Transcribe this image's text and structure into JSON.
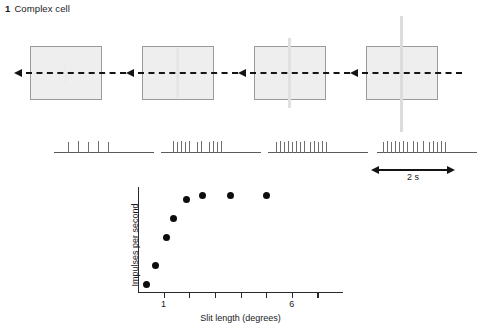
{
  "figure": {
    "number": "1",
    "title": "Complex cell"
  },
  "stimuli": {
    "panels": [
      {
        "id": "panel-1",
        "slit_class": "s1",
        "left": 14,
        "slit_length_deg": 0.7,
        "direction_icon": "left-arrow-icon"
      },
      {
        "id": "panel-2",
        "slit_class": "s2",
        "left": 126,
        "slit_length_deg": 2.0,
        "direction_icon": "left-arrow-icon"
      },
      {
        "id": "panel-3",
        "slit_class": "s3",
        "left": 238,
        "slit_length_deg": 3.5,
        "direction_icon": "left-arrow-icon"
      },
      {
        "id": "panel-4",
        "slit_class": "s4",
        "left": 350,
        "slit_length_deg": 6.0,
        "direction_icon": "left-arrow-icon"
      }
    ]
  },
  "spike_trains": [
    {
      "id": "spike-train-1",
      "left": 48,
      "spike_count": 5,
      "spikes": [
        {
          "x": 20,
          "h": 11
        },
        {
          "x": 30,
          "h": 12
        },
        {
          "x": 40,
          "h": 11
        },
        {
          "x": 50,
          "h": 12
        },
        {
          "x": 60,
          "h": 11
        }
      ]
    },
    {
      "id": "spike-train-2",
      "left": 155,
      "spike_count": 11,
      "spikes": [
        {
          "x": 18,
          "h": 12
        },
        {
          "x": 22,
          "h": 11
        },
        {
          "x": 26,
          "h": 12
        },
        {
          "x": 30,
          "h": 11
        },
        {
          "x": 34,
          "h": 12
        },
        {
          "x": 42,
          "h": 11
        },
        {
          "x": 46,
          "h": 12
        },
        {
          "x": 54,
          "h": 11
        },
        {
          "x": 58,
          "h": 12
        },
        {
          "x": 62,
          "h": 11
        },
        {
          "x": 66,
          "h": 12
        }
      ]
    },
    {
      "id": "spike-train-3",
      "left": 262,
      "spike_count": 13,
      "spikes": [
        {
          "x": 14,
          "h": 11
        },
        {
          "x": 18,
          "h": 12
        },
        {
          "x": 22,
          "h": 11
        },
        {
          "x": 26,
          "h": 12
        },
        {
          "x": 30,
          "h": 11
        },
        {
          "x": 34,
          "h": 12
        },
        {
          "x": 38,
          "h": 11
        },
        {
          "x": 42,
          "h": 12
        },
        {
          "x": 48,
          "h": 11
        },
        {
          "x": 52,
          "h": 12
        },
        {
          "x": 56,
          "h": 11
        },
        {
          "x": 60,
          "h": 12
        },
        {
          "x": 64,
          "h": 11
        }
      ]
    },
    {
      "id": "spike-train-4",
      "left": 371,
      "spike_count": 15,
      "spikes": [
        {
          "x": 12,
          "h": 11
        },
        {
          "x": 16,
          "h": 12
        },
        {
          "x": 20,
          "h": 11
        },
        {
          "x": 24,
          "h": 12
        },
        {
          "x": 28,
          "h": 11
        },
        {
          "x": 32,
          "h": 12
        },
        {
          "x": 36,
          "h": 11
        },
        {
          "x": 42,
          "h": 12
        },
        {
          "x": 46,
          "h": 11
        },
        {
          "x": 52,
          "h": 12
        },
        {
          "x": 58,
          "h": 11
        },
        {
          "x": 62,
          "h": 12
        },
        {
          "x": 66,
          "h": 11
        },
        {
          "x": 70,
          "h": 12
        },
        {
          "x": 74,
          "h": 11
        }
      ]
    }
  ],
  "scalebar": {
    "label": "2 s",
    "left_arrow_icon": "left-arrow-icon",
    "right_arrow_icon": "right-arrow-icon"
  },
  "chart_data": {
    "type": "scatter",
    "title": "",
    "xlabel": "Slit length (degrees)",
    "ylabel": "Impulses per second",
    "xlim": [
      0,
      8
    ],
    "ylim": [
      0,
      100
    ],
    "grid": false,
    "legend": null,
    "xticks": [
      0,
      1,
      2,
      3,
      4,
      5,
      6,
      7
    ],
    "xtick_labels": [
      {
        "value": 1,
        "label": "1"
      },
      {
        "value": 6,
        "label": "6"
      }
    ],
    "yticks": [],
    "ytick_labels": [],
    "x": [
      0.35,
      0.7,
      1.1,
      1.4,
      1.8,
      2.4,
      3.1,
      4.4,
      6.2
    ],
    "y": [
      8,
      26,
      52,
      70,
      88,
      92,
      92,
      92,
      92
    ],
    "points": [
      {
        "x": 0.35,
        "y": 8
      },
      {
        "x": 0.7,
        "y": 26
      },
      {
        "x": 1.1,
        "y": 52
      },
      {
        "x": 1.4,
        "y": 70
      },
      {
        "x": 1.9,
        "y": 88
      },
      {
        "x": 2.5,
        "y": 92
      },
      {
        "x": 3.6,
        "y": 92
      },
      {
        "x": 5.0,
        "y": 92
      }
    ]
  }
}
